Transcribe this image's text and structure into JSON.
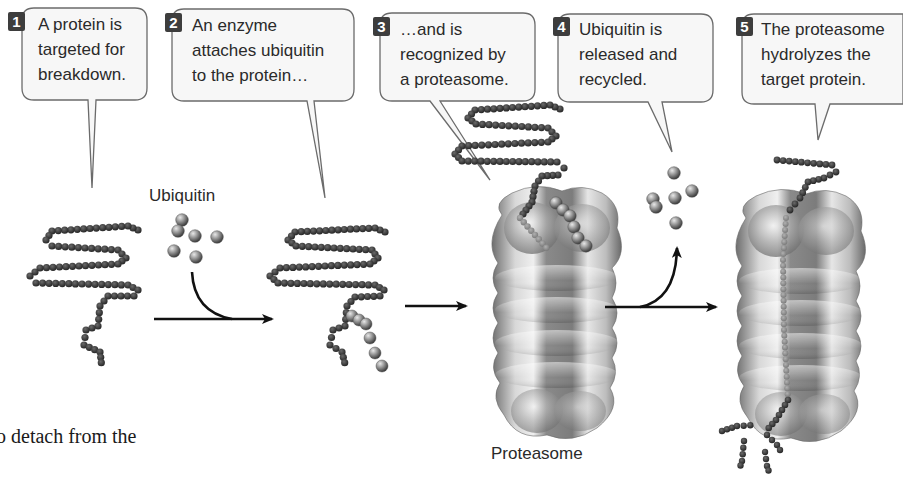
{
  "figure": {
    "colors": {
      "bubble_fill": "#f7f7f7",
      "bubble_stroke": "#6b6b6b",
      "badge_fill": "#3d3d3d",
      "protein_bead": "#3a3a3a",
      "ubiquitin_bead": "#8a8a8a",
      "proteasome": "#9a9a9a",
      "arrow": "#111111"
    }
  },
  "steps": [
    {
      "number": "1",
      "lines": [
        "A protein is",
        "targeted for",
        "breakdown."
      ]
    },
    {
      "number": "2",
      "lines": [
        "An enzyme",
        "attaches ubiquitin",
        "to the protein…"
      ]
    },
    {
      "number": "3",
      "lines": [
        "…and is",
        "recognized by",
        "a proteasome."
      ]
    },
    {
      "number": "4",
      "lines": [
        "Ubiquitin is",
        "released and",
        "recycled."
      ]
    },
    {
      "number": "5",
      "lines": [
        "The proteasome",
        "hydrolyzes the",
        "target protein."
      ]
    }
  ],
  "labels": {
    "ubiquitin": "Ubiquitin",
    "proteasome": "Proteasome"
  },
  "body_text_fragment": "o detach from the"
}
